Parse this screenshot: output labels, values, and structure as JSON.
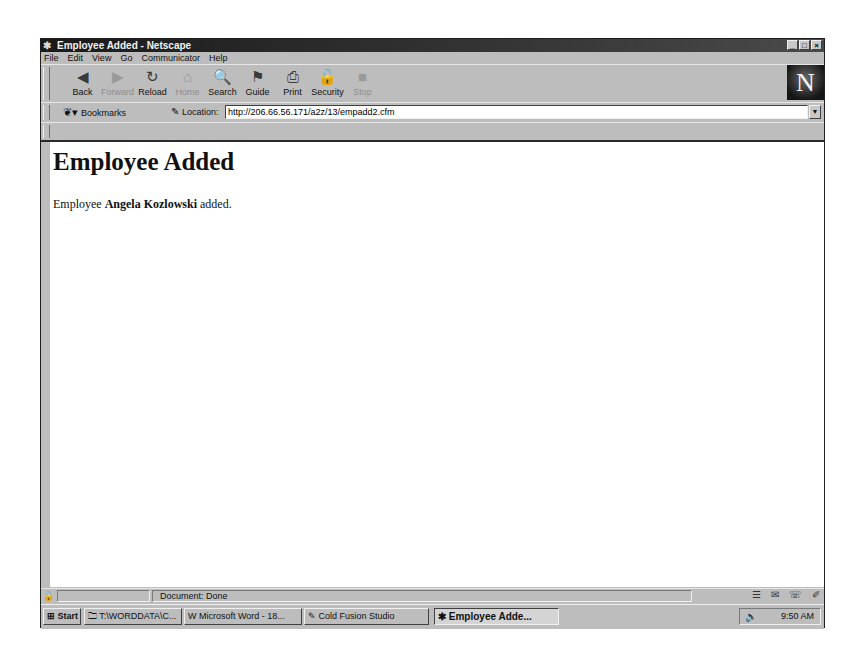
{
  "window": {
    "title": "Employee Added - Netscape",
    "controls": [
      "_",
      "□",
      "×"
    ]
  },
  "menu": {
    "items": [
      "File",
      "Edit",
      "View",
      "Go",
      "Communicator",
      "Help"
    ]
  },
  "navigation_toolbar": {
    "buttons": [
      {
        "label": "Back",
        "icon": "back-arrow-icon",
        "glyph": "◀",
        "enabled": true
      },
      {
        "label": "Forward",
        "icon": "forward-arrow-icon",
        "glyph": "▶",
        "enabled": false
      },
      {
        "label": "Reload",
        "icon": "reload-icon",
        "glyph": "↻",
        "enabled": true
      },
      {
        "label": "Home",
        "icon": "home-icon",
        "glyph": "⌂",
        "enabled": false
      },
      {
        "label": "Search",
        "icon": "search-icon",
        "glyph": "🔍",
        "enabled": true
      },
      {
        "label": "Guide",
        "icon": "guide-icon",
        "glyph": "⚑",
        "enabled": true
      },
      {
        "label": "Print",
        "icon": "print-icon",
        "glyph": "⎙",
        "enabled": true
      },
      {
        "label": "Security",
        "icon": "lock-icon",
        "glyph": "🔓",
        "enabled": true
      },
      {
        "label": "Stop",
        "icon": "stop-icon",
        "glyph": "■",
        "enabled": false
      }
    ],
    "logo": "N"
  },
  "location_toolbar": {
    "bookmarks_label": "Bookmarks",
    "location_label": "Location:",
    "url": "http://206.66.56.171/a2z/13/empadd2.cfm"
  },
  "page": {
    "heading": "Employee Added",
    "message_prefix": "Employee ",
    "employee_name": "Angela Kozlowski",
    "message_suffix": " added."
  },
  "status_bar": {
    "text": "Document: Done"
  },
  "taskbar": {
    "start_label": "Start",
    "tasks": [
      {
        "label": "T:\\WORDDATA\\C...",
        "active": false
      },
      {
        "label": "Microsoft Word - 18...",
        "active": false
      },
      {
        "label": "Cold Fusion Studio",
        "active": false
      },
      {
        "label": "Employee Adde...",
        "active": true
      }
    ],
    "clock": "9:50 AM"
  }
}
